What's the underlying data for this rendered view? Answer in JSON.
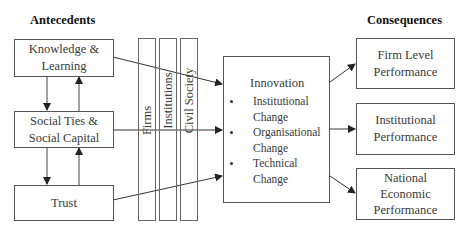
{
  "headings": {
    "antecedents": "Antecedents",
    "consequences": "Consequences"
  },
  "antecedents": [
    {
      "label": "Knowledge & Learning",
      "line1": "Knowledge &",
      "line2": "Learning"
    },
    {
      "label": "Social Ties & Social Capital",
      "line1": "Social Ties &",
      "line2": "Social Capital"
    },
    {
      "label": "Trust",
      "line1": "Trust"
    }
  ],
  "mediators": [
    {
      "label": "Firms"
    },
    {
      "label": "Institutions"
    },
    {
      "label": "Civil Society"
    }
  ],
  "innovation": {
    "title": "Innovation",
    "items": [
      {
        "line1": "Institutional",
        "line2": "Change"
      },
      {
        "line1": "Organisational",
        "line2": "Change"
      },
      {
        "line1": "Technical",
        "line2": "Change"
      }
    ]
  },
  "consequences": [
    {
      "line1": "Firm Level",
      "line2": "Performance"
    },
    {
      "line1": "Institutional",
      "line2": "Performance"
    },
    {
      "line1": "National",
      "line2": "Economic",
      "line3": "Performance"
    }
  ],
  "colors": {
    "line": "#333333",
    "text": "#3a3a3a",
    "heading": "#111111"
  }
}
